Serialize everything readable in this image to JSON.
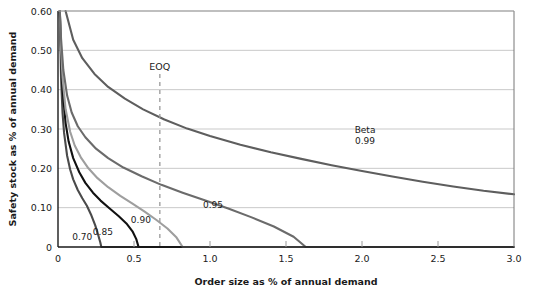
{
  "chart_data": {
    "type": "line",
    "title": "",
    "xlabel": "Order size as % of annual demand",
    "ylabel": "Safety stock as % of annual demand",
    "xlim": [
      0,
      3.0
    ],
    "ylim": [
      0,
      0.6
    ],
    "xticks": [
      "0",
      "0.5",
      "1.0",
      "1.5",
      "2.0",
      "2.5",
      "3.0"
    ],
    "xtick_values": [
      0,
      0.5,
      1.0,
      1.5,
      2.0,
      2.5,
      3.0
    ],
    "yticks": [
      "0",
      "0.10",
      "0.20",
      "0.30",
      "0.40",
      "0.50",
      "0.60"
    ],
    "ytick_values": [
      0,
      0.1,
      0.2,
      0.3,
      0.4,
      0.5,
      0.6
    ],
    "grid": "horizontal",
    "legend_position": "inline-curve-labels",
    "legend_title": "Beta",
    "annotations": [
      {
        "name": "eoq-marker",
        "text": "EOQ",
        "x": 0.67,
        "type": "vertical-dashed-line"
      }
    ],
    "series": [
      {
        "name": "0.70",
        "label": "0.70",
        "color": "#4a4a4a",
        "label_x": 0.16,
        "label_y": 0.018,
        "points": [
          [
            0.012,
            0.6
          ],
          [
            0.02,
            0.43
          ],
          [
            0.03,
            0.34
          ],
          [
            0.04,
            0.29
          ],
          [
            0.06,
            0.232
          ],
          [
            0.08,
            0.197
          ],
          [
            0.1,
            0.172
          ],
          [
            0.13,
            0.145
          ],
          [
            0.16,
            0.124
          ],
          [
            0.19,
            0.105
          ],
          [
            0.22,
            0.08
          ],
          [
            0.245,
            0.055
          ],
          [
            0.265,
            0.03
          ],
          [
            0.278,
            0.012
          ],
          [
            0.285,
            0.0
          ],
          [
            3.0,
            0.0
          ]
        ]
      },
      {
        "name": "0.85",
        "label": "0.85",
        "color": "#111111",
        "label_x": 0.295,
        "label_y": 0.03,
        "points": [
          [
            0.012,
            0.6
          ],
          [
            0.02,
            0.49
          ],
          [
            0.03,
            0.4
          ],
          [
            0.05,
            0.315
          ],
          [
            0.07,
            0.268
          ],
          [
            0.1,
            0.226
          ],
          [
            0.14,
            0.19
          ],
          [
            0.18,
            0.163
          ],
          [
            0.23,
            0.138
          ],
          [
            0.28,
            0.118
          ],
          [
            0.34,
            0.098
          ],
          [
            0.4,
            0.078
          ],
          [
            0.45,
            0.06
          ],
          [
            0.49,
            0.04
          ],
          [
            0.515,
            0.02
          ],
          [
            0.53,
            0.0
          ],
          [
            3.0,
            0.0
          ]
        ]
      },
      {
        "name": "0.90",
        "label": "0.90",
        "color": "#9e9e9e",
        "label_x": 0.545,
        "label_y": 0.06,
        "points": [
          [
            0.012,
            0.6
          ],
          [
            0.02,
            0.505
          ],
          [
            0.03,
            0.43
          ],
          [
            0.05,
            0.35
          ],
          [
            0.08,
            0.293
          ],
          [
            0.11,
            0.258
          ],
          [
            0.15,
            0.228
          ],
          [
            0.2,
            0.2
          ],
          [
            0.26,
            0.175
          ],
          [
            0.33,
            0.152
          ],
          [
            0.41,
            0.13
          ],
          [
            0.49,
            0.11
          ],
          [
            0.57,
            0.09
          ],
          [
            0.65,
            0.068
          ],
          [
            0.72,
            0.047
          ],
          [
            0.78,
            0.024
          ],
          [
            0.82,
            0.0
          ],
          [
            3.0,
            0.0
          ]
        ]
      },
      {
        "name": "0.95",
        "label": "0.95",
        "color": "#6b6b6b",
        "label_x": 1.02,
        "label_y": 0.098,
        "points": [
          [
            0.012,
            0.6
          ],
          [
            0.02,
            0.53
          ],
          [
            0.035,
            0.45
          ],
          [
            0.06,
            0.385
          ],
          [
            0.09,
            0.342
          ],
          [
            0.13,
            0.307
          ],
          [
            0.18,
            0.279
          ],
          [
            0.25,
            0.25
          ],
          [
            0.33,
            0.226
          ],
          [
            0.43,
            0.202
          ],
          [
            0.55,
            0.18
          ],
          [
            0.68,
            0.158
          ],
          [
            0.82,
            0.138
          ],
          [
            0.97,
            0.118
          ],
          [
            1.12,
            0.098
          ],
          [
            1.27,
            0.076
          ],
          [
            1.42,
            0.052
          ],
          [
            1.55,
            0.026
          ],
          [
            1.63,
            0.0
          ],
          [
            3.0,
            0.0
          ]
        ]
      },
      {
        "name": "0.99",
        "label": "0.99",
        "color": "#5e5e5e",
        "label_x": 2.02,
        "label_y": 0.262,
        "points": [
          [
            0.05,
            0.6
          ],
          [
            0.1,
            0.527
          ],
          [
            0.16,
            0.48
          ],
          [
            0.24,
            0.44
          ],
          [
            0.33,
            0.407
          ],
          [
            0.44,
            0.377
          ],
          [
            0.56,
            0.35
          ],
          [
            0.7,
            0.324
          ],
          [
            0.85,
            0.301
          ],
          [
            1.0,
            0.282
          ],
          [
            1.2,
            0.26
          ],
          [
            1.4,
            0.241
          ],
          [
            1.6,
            0.224
          ],
          [
            1.8,
            0.208
          ],
          [
            2.0,
            0.193
          ],
          [
            2.2,
            0.179
          ],
          [
            2.4,
            0.166
          ],
          [
            2.6,
            0.154
          ],
          [
            2.8,
            0.143
          ],
          [
            3.0,
            0.134
          ]
        ]
      }
    ]
  },
  "colors": {
    "axis": "#1a1a1a",
    "grid": "#c9c9c9",
    "eoq_line": "#9a9a9a",
    "background": "#ffffff"
  }
}
